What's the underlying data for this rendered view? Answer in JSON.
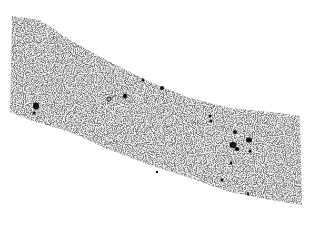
{
  "image": {
    "description": "Grayscale micrograph of a tissue section strip with scattered dark stained spots on a light speckled background",
    "background": "#ffffff",
    "tissue_color": "#d8d8d8",
    "spot_color": "#111111"
  }
}
